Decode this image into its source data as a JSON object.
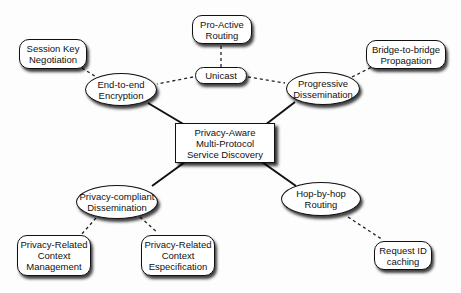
{
  "diagram": {
    "center": {
      "label": "Privacy-Aware\nMulti-Protocol\nService Discovery"
    },
    "nodes": {
      "pro_active_routing": {
        "label": "Pro-Active\nRouting"
      },
      "unicast": {
        "label": "Unicast"
      },
      "session_key_negotiation": {
        "label": "Session Key\nNegotiation"
      },
      "end_to_end_encryption": {
        "label": "End-to-end\nEncryption"
      },
      "progressive_dissemination": {
        "label": "Progressive\nDissemination"
      },
      "bridge_to_bridge_propagation": {
        "label": "Bridge-to-bridge\nPropagation"
      },
      "privacy_compliant_dissemination": {
        "label": "Privacy-compliant\nDissemination"
      },
      "privacy_related_context_management": {
        "label": "Privacy-Related\nContext\nManagement"
      },
      "privacy_related_context_especification": {
        "label": "Privacy-Related\nContext\nEspecification"
      },
      "hop_by_hop_routing": {
        "label": "Hop-by-hop\nRouting"
      },
      "request_id_caching": {
        "label": "Request ID\ncaching"
      }
    },
    "edges": [
      {
        "from": "center",
        "to": "end_to_end_encryption",
        "style": "solid"
      },
      {
        "from": "center",
        "to": "progressive_dissemination",
        "style": "solid"
      },
      {
        "from": "center",
        "to": "privacy_compliant_dissemination",
        "style": "solid"
      },
      {
        "from": "center",
        "to": "hop_by_hop_routing",
        "style": "solid"
      },
      {
        "from": "pro_active_routing",
        "to": "unicast",
        "style": "dashed"
      },
      {
        "from": "unicast",
        "to": "end_to_end_encryption",
        "style": "dashed"
      },
      {
        "from": "unicast",
        "to": "progressive_dissemination",
        "style": "dashed"
      },
      {
        "from": "session_key_negotiation",
        "to": "end_to_end_encryption",
        "style": "dashed"
      },
      {
        "from": "progressive_dissemination",
        "to": "bridge_to_bridge_propagation",
        "style": "dashed"
      },
      {
        "from": "privacy_compliant_dissemination",
        "to": "privacy_related_context_management",
        "style": "dashed"
      },
      {
        "from": "privacy_compliant_dissemination",
        "to": "privacy_related_context_especification",
        "style": "dashed"
      },
      {
        "from": "hop_by_hop_routing",
        "to": "request_id_caching",
        "style": "dashed"
      }
    ]
  }
}
